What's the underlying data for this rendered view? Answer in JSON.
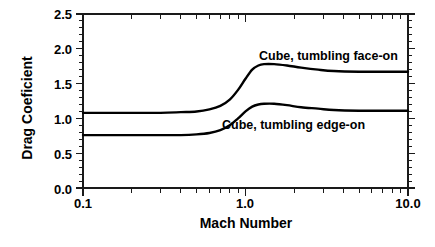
{
  "chart_data": {
    "type": "line",
    "title": "",
    "xlabel": "Mach Number",
    "ylabel": "Drag Coeficient",
    "xscale": "log",
    "yscale": "linear",
    "xlim": [
      0.1,
      10.0
    ],
    "ylim": [
      0.0,
      2.5
    ],
    "grid": false,
    "legend_position": "inline-annotation",
    "x_major_ticks": [
      0.1,
      1.0,
      10.0
    ],
    "x_major_tick_labels": [
      "0.1",
      "1.0",
      "10.0"
    ],
    "x_minor_ticks": [
      0.2,
      0.3,
      0.4,
      0.5,
      0.6,
      0.7,
      0.8,
      0.9,
      2.0,
      3.0,
      4.0,
      5.0,
      6.0,
      7.0,
      8.0,
      9.0
    ],
    "y_major_ticks": [
      0.0,
      0.5,
      1.0,
      1.5,
      2.0,
      2.5
    ],
    "y_major_tick_labels": [
      "0.0",
      "0.5",
      "1.0",
      "1.5",
      "2.0",
      "2.5"
    ],
    "y_minor_tick_step": 0.1,
    "series": [
      {
        "name": "Cube, tumbling face-on",
        "color": "#000000",
        "x": [
          0.1,
          0.2,
          0.3,
          0.4,
          0.5,
          0.6,
          0.7,
          0.8,
          0.9,
          1.0,
          1.1,
          1.2,
          1.3,
          1.5,
          1.8,
          2.2,
          2.8,
          3.5,
          5.0,
          7.0,
          10.0
        ],
        "y": [
          1.08,
          1.08,
          1.08,
          1.09,
          1.1,
          1.13,
          1.18,
          1.27,
          1.41,
          1.57,
          1.7,
          1.76,
          1.78,
          1.78,
          1.76,
          1.73,
          1.7,
          1.68,
          1.67,
          1.67,
          1.67
        ]
      },
      {
        "name": "Cube, tumbling edge-on",
        "color": "#000000",
        "x": [
          0.1,
          0.2,
          0.3,
          0.4,
          0.5,
          0.6,
          0.7,
          0.8,
          0.9,
          1.0,
          1.1,
          1.2,
          1.3,
          1.5,
          1.8,
          2.2,
          2.8,
          3.5,
          5.0,
          7.0,
          10.0
        ],
        "y": [
          0.76,
          0.76,
          0.76,
          0.76,
          0.77,
          0.79,
          0.83,
          0.9,
          1.0,
          1.1,
          1.17,
          1.2,
          1.21,
          1.21,
          1.19,
          1.16,
          1.14,
          1.12,
          1.11,
          1.11,
          1.11
        ]
      }
    ],
    "annotations": [
      {
        "text": "Cube, tumbling face-on",
        "x": 1.55,
        "y": 1.95
      },
      {
        "text": "Cube, tumbling edge-on",
        "x": 1.45,
        "y": 0.93
      }
    ]
  },
  "labels": {
    "ylabel": "Drag Coeficient",
    "xlabel": "Mach Number",
    "annotation_face_on": "Cube, tumbling face-on",
    "annotation_edge_on": "Cube, tumbling edge-on",
    "ytick_0": "0.0",
    "ytick_1": "0.5",
    "ytick_2": "1.0",
    "ytick_3": "1.5",
    "ytick_4": "2.0",
    "ytick_5": "2.5",
    "xtick_0": "0.1",
    "xtick_1": "1.0",
    "xtick_2": "10.0"
  },
  "colors": {
    "axis": "#1a1a1a",
    "curve": "#000000",
    "background": "#ffffff"
  }
}
